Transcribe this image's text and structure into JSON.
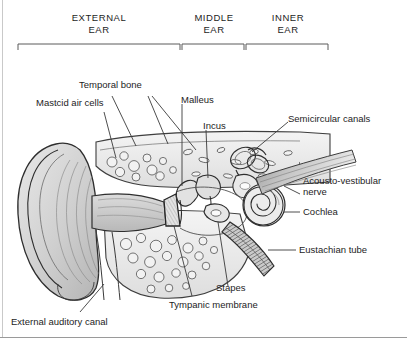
{
  "figure": {
    "type": "anatomical-illustration",
    "background_color": "#ffffff",
    "text_color": "#1d1d1d",
    "line_color": "#3a3a3a",
    "border_color": "#9a9a9a"
  },
  "regions": [
    {
      "id": "external",
      "label": "EXTERNAL\nEAR",
      "bracket": {
        "x1": 18,
        "x2": 180,
        "y": 44
      }
    },
    {
      "id": "middle",
      "label": "MIDDLE\nEAR",
      "bracket": {
        "x1": 182,
        "x2": 244,
        "y": 44
      }
    },
    {
      "id": "inner",
      "label": "INNER\nEAR",
      "bracket": {
        "x1": 246,
        "x2": 328,
        "y": 44
      }
    }
  ],
  "callouts": [
    {
      "id": "temporal-bone",
      "label": "Temporal bone"
    },
    {
      "id": "mastoid-air-cells",
      "label": "Mastcid air cells"
    },
    {
      "id": "malleus",
      "label": "Malleus"
    },
    {
      "id": "incus",
      "label": "Incus"
    },
    {
      "id": "semicircular-canals",
      "label": "Semicircular canals"
    },
    {
      "id": "acousto-vestibular-nerve",
      "label": "Acousto-vestibular\nnerve"
    },
    {
      "id": "cochlea",
      "label": "Cochlea"
    },
    {
      "id": "eustachian-tube",
      "label": "Eustachian tube"
    },
    {
      "id": "stapes",
      "label": "Stapes"
    },
    {
      "id": "tympanic-membrane",
      "label": "Tympanic membrane"
    },
    {
      "id": "external-auditory-canal",
      "label": "External auditory canal"
    }
  ]
}
